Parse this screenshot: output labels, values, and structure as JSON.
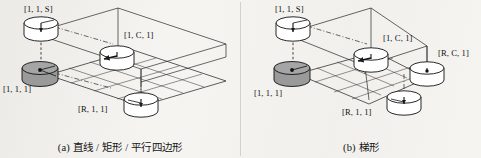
{
  "figure": {
    "background_color": "#f5f4f1",
    "ink_color": "#1a1a1a",
    "shaded_node_color": "#9a9a9a"
  },
  "panels": [
    {
      "id": "a",
      "caption_index": "(a)",
      "caption_text": "直线 / 矩形 / 平行四边形",
      "caption_full": "(a) 直线 / 矩形 / 平行四边形",
      "nodes": [
        {
          "name": "node-1-1-S",
          "label": "[1, 1, S]",
          "shaded": false
        },
        {
          "name": "node-1-1-1",
          "label": "[1, 1, 1]",
          "shaded": true
        },
        {
          "name": "node-1-C-1",
          "label": "[1, C, 1]",
          "shaded": false
        },
        {
          "name": "node-R-1-1",
          "label": "[R, 1, 1]",
          "shaded": false
        }
      ]
    },
    {
      "id": "b",
      "caption_index": "(b)",
      "caption_text": "梯形",
      "caption_full": "(b) 梯形",
      "nodes": [
        {
          "name": "node-1-1-S",
          "label": "[1, 1, S]",
          "shaded": false
        },
        {
          "name": "node-1-1-1",
          "label": "[1, 1, 1]",
          "shaded": true
        },
        {
          "name": "node-1-C-1",
          "label": "[1, C, 1]",
          "shaded": false
        },
        {
          "name": "node-R-C-1",
          "label": "[R, C, 1]",
          "shaded": false
        },
        {
          "name": "node-R-1-1",
          "label": "[R, 1, 1]",
          "shaded": false
        }
      ]
    }
  ],
  "labels": {
    "a": {
      "n1": "[1, 1, S]",
      "n2": "[1, C, 1]",
      "n3": "[1, 1, 1]",
      "n4": "[R, 1, 1]"
    },
    "b": {
      "n1": "[1, 1, S]",
      "n2": "[1, C, 1]",
      "n3": "[R, C, 1]",
      "n4": "[1, 1, 1]",
      "n5": "[R, 1, 1]"
    }
  },
  "captions": {
    "a": "(a) 直线 / 矩形 / 平行四边形",
    "b": "(b) 梯形"
  }
}
